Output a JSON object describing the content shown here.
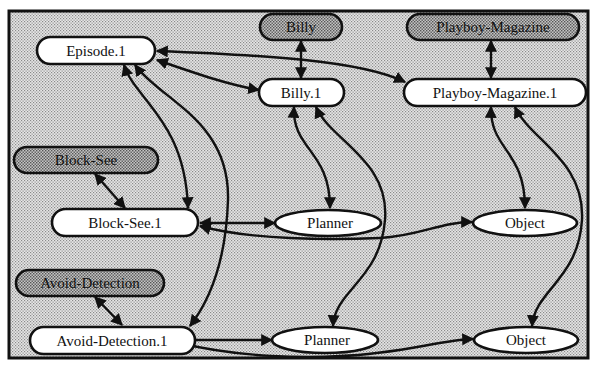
{
  "diagram": {
    "type": "directed-graph",
    "colors": {
      "background_pattern": "#d9d9d9",
      "node_fill": "#ffffff",
      "shaded_node_fill": "#bdbdbd",
      "stroke": "#111111"
    },
    "nodes": {
      "billy": {
        "label": "Billy",
        "shape": "rounded-rect",
        "shaded": true
      },
      "playboy_magazine": {
        "label": "Playboy-Magazine",
        "shape": "rounded-rect",
        "shaded": true
      },
      "episode_1": {
        "label": "Episode.1",
        "shape": "rounded-rect",
        "shaded": false
      },
      "billy_1": {
        "label": "Billy.1",
        "shape": "rounded-rect",
        "shaded": false
      },
      "playboy_magazine_1": {
        "label": "Playboy-Magazine.1",
        "shape": "rounded-rect",
        "shaded": false
      },
      "block_see": {
        "label": "Block-See",
        "shape": "rounded-rect",
        "shaded": true
      },
      "block_see_1": {
        "label": "Block-See.1",
        "shape": "rounded-rect",
        "shaded": false
      },
      "planner_top": {
        "label": "Planner",
        "shape": "ellipse",
        "shaded": false
      },
      "object_top": {
        "label": "Object",
        "shape": "ellipse",
        "shaded": false
      },
      "avoid_detection": {
        "label": "Avoid-Detection",
        "shape": "rounded-rect",
        "shaded": true
      },
      "avoid_detection_1": {
        "label": "Avoid-Detection.1",
        "shape": "rounded-rect",
        "shaded": false
      },
      "planner_bottom": {
        "label": "Planner",
        "shape": "ellipse",
        "shaded": false
      },
      "object_bottom": {
        "label": "Object",
        "shape": "ellipse",
        "shaded": false
      }
    },
    "edges": [
      {
        "from": "Billy",
        "to": "Billy.1",
        "bidirectional": true
      },
      {
        "from": "Playboy-Magazine",
        "to": "Playboy-Magazine.1",
        "bidirectional": true
      },
      {
        "from": "Episode.1",
        "to": "Billy.1",
        "bidirectional": true
      },
      {
        "from": "Episode.1",
        "to": "Playboy-Magazine.1",
        "bidirectional": true
      },
      {
        "from": "Episode.1",
        "to": "Block-See.1",
        "bidirectional": true
      },
      {
        "from": "Episode.1",
        "to": "Avoid-Detection.1",
        "bidirectional": true
      },
      {
        "from": "Block-See",
        "to": "Block-See.1",
        "bidirectional": true
      },
      {
        "from": "Avoid-Detection",
        "to": "Avoid-Detection.1",
        "bidirectional": true
      },
      {
        "from": "Billy.1",
        "to": "Planner (top)",
        "bidirectional": true
      },
      {
        "from": "Billy.1",
        "to": "Planner (bottom)",
        "bidirectional": true
      },
      {
        "from": "Playboy-Magazine.1",
        "to": "Object (top)",
        "bidirectional": true
      },
      {
        "from": "Playboy-Magazine.1",
        "to": "Object (bottom)",
        "bidirectional": true
      },
      {
        "from": "Block-See.1",
        "to": "Planner (top)",
        "bidirectional": true
      },
      {
        "from": "Block-See.1",
        "to": "Object (top)",
        "bidirectional": true
      },
      {
        "from": "Avoid-Detection.1",
        "to": "Planner (bottom)",
        "bidirectional": true
      },
      {
        "from": "Avoid-Detection.1",
        "to": "Object (bottom)",
        "bidirectional": true
      }
    ]
  }
}
